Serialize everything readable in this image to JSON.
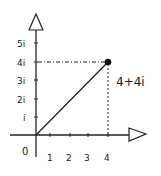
{
  "diagram": {
    "type": "complex-plane",
    "origin_label": "0",
    "x_ticks": [
      "1",
      "2",
      "3",
      "4"
    ],
    "y_ticks": [
      "i",
      "2i",
      "3i",
      "4i",
      "5i"
    ],
    "point": {
      "label": "4+4i",
      "re": 4,
      "im": 4
    },
    "colors": {
      "stroke": "#222222",
      "background": "#ffffff"
    }
  }
}
